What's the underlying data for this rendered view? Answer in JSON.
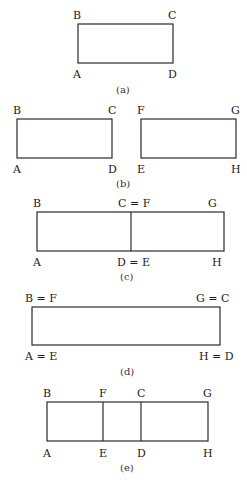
{
  "panels": {
    "a": {
      "caption": "(a)",
      "labels": {
        "top_left": "B",
        "top_right": "C",
        "bottom_left": "A",
        "bottom_right": "D"
      }
    },
    "b": {
      "caption": "(b)",
      "left": {
        "top_left": "B",
        "top_right": "C",
        "bottom_left": "A",
        "bottom_right": "D"
      },
      "right": {
        "top_left": "F",
        "top_right": "G",
        "bottom_left": "E",
        "bottom_right": "H"
      }
    },
    "c": {
      "caption": "(c)",
      "labels": {
        "top_left": "B",
        "top_mid": "C = F",
        "top_right": "G",
        "bottom_left": "A",
        "bottom_mid": "D = E",
        "bottom_right": "H"
      }
    },
    "d": {
      "caption": "(d)",
      "labels": {
        "top_left": "B = F",
        "top_right": "G = C",
        "bottom_left": "A = E",
        "bottom_right": "H = D"
      }
    },
    "e": {
      "caption": "(e)",
      "labels": {
        "top_1": "B",
        "top_2": "F",
        "top_3": "C",
        "top_4": "G",
        "bottom_1": "A",
        "bottom_2": "E",
        "bottom_3": "D",
        "bottom_4": "H"
      }
    }
  }
}
